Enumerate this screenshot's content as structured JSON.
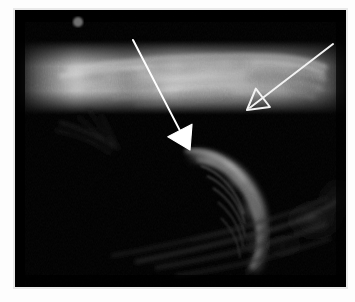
{
  "image": {
    "kind": "ultrasound-b-mode-grayscale",
    "modality_label": "ultrasound",
    "frame": {
      "background_color": "#fdfdfd",
      "border_color": "#e9e9e9",
      "scan_background_color": "#000000",
      "scan_x": 15,
      "scan_y": 10,
      "scan_width": 331,
      "scan_height": 277
    }
  },
  "annotations": {
    "solid_arrow": {
      "name": "solid white arrow",
      "color": "#ffffff",
      "tail_x": 118,
      "tail_y": 30,
      "tip_x": 175,
      "tip_y": 140,
      "shaft_width": 2,
      "head_style": "filled-triangle",
      "head_size": 22
    },
    "open_arrow": {
      "name": "open outlined arrow",
      "color": "#f2f2f2",
      "tail_x": 318,
      "tail_y": 34,
      "tip_x": 232,
      "tip_y": 100,
      "shaft_width": 2,
      "head_style": "hollow-triangle",
      "head_size": 20
    },
    "orientation_marker": {
      "name": "orientation dot marker",
      "color": "#6e6e6e",
      "cx": 63,
      "cy": 12,
      "r": 5
    }
  },
  "structures": [
    {
      "id": "superficial-band",
      "label": "bright horizontal fibrillar band",
      "brightness": "high",
      "peak_gray": "#d6d6d6"
    },
    {
      "id": "curved-crescent",
      "label": "curved crescentic hyperechoic interface",
      "brightness": "medium-high",
      "peak_gray": "#a8a8a8"
    },
    {
      "id": "deep-streaks",
      "label": "faint deep diagonal reflections",
      "brightness": "low",
      "peak_gray": "#3a3a3a"
    },
    {
      "id": "left-speckle",
      "label": "faint left-sided speckle",
      "brightness": "very-low",
      "peak_gray": "#2a2a2a"
    }
  ],
  "chart_data": {
    "type": "heatmap",
    "title": "",
    "xlabel": "",
    "ylabel": "",
    "colormap": "grayscale",
    "value_range": [
      0,
      255
    ],
    "note": "B-mode ultrasound echo intensity field"
  }
}
